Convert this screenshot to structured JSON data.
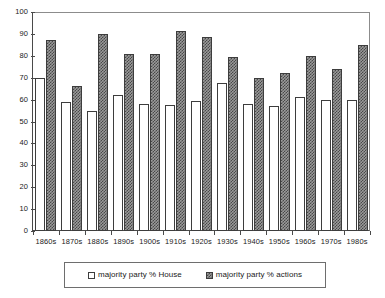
{
  "chart_data": {
    "type": "bar",
    "title": "",
    "xlabel": "",
    "ylabel": "",
    "ylim": [
      0,
      100
    ],
    "ytick_step": 10,
    "yticks": [
      "100",
      "90",
      "80",
      "70",
      "60",
      "50",
      "40",
      "30",
      "20",
      "10",
      "0"
    ],
    "grid": false,
    "legend_position": "bottom",
    "categories": [
      "1860s",
      "1870s",
      "1880s",
      "1890s",
      "1900s",
      "1910s",
      "1920s",
      "1930s",
      "1940s",
      "1950s",
      "1960s",
      "1970s",
      "1980s"
    ],
    "series": [
      {
        "name": "majority party % House",
        "fill": "white",
        "values": [
          70,
          59,
          55,
          62,
          58,
          57.5,
          59.5,
          67.5,
          58,
          57,
          61,
          60,
          60
        ]
      },
      {
        "name": "majority party % actions",
        "fill": "hatched-gray",
        "values": [
          87,
          66,
          90,
          81,
          81,
          91.5,
          88.5,
          79.5,
          70,
          72,
          80,
          74,
          85
        ]
      }
    ]
  },
  "legend": {
    "entries": [
      {
        "label": "majority party % House"
      },
      {
        "label": "majority party % actions"
      }
    ]
  },
  "colors": {
    "axis": "#4a4a4a",
    "frame": "#8c8c8c",
    "bar_outline": "#3d3d3d",
    "hatch_dark": "#484848",
    "hatch_light": "#9a9a9a",
    "text": "#1a1a1a",
    "background": "#ffffff"
  }
}
